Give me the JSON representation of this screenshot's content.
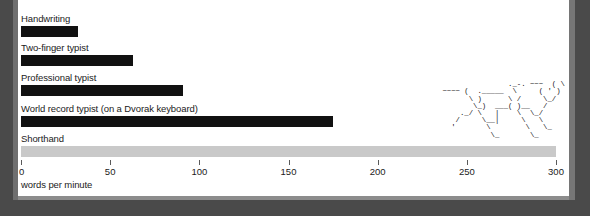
{
  "chart_data": {
    "type": "bar",
    "orientation": "horizontal",
    "title": "",
    "xlabel": "words per minute",
    "ylabel": "",
    "xlim": [
      0,
      300
    ],
    "ticks": [
      0,
      50,
      100,
      150,
      200,
      250,
      300
    ],
    "tick_labels": [
      "0",
      "50",
      "100",
      "150",
      "200",
      "250",
      "300"
    ],
    "grid": false,
    "legend": "none",
    "categories": [
      "Handwriting",
      "Two-finger typist",
      "Professional typist",
      "World record typist (on a Dvorak keyboard)",
      "Shorthand"
    ],
    "values": [
      32,
      63,
      91,
      175,
      300
    ],
    "bar_colors": [
      "#111111",
      "#111111",
      "#111111",
      "#111111",
      "#c9c9c9"
    ],
    "annotations": [
      "ascii-horse-drawing"
    ]
  },
  "axis": {
    "title": "words per minute"
  },
  "illustration": {
    "name": "ascii-horse",
    "art": "                              ~~~\n                ._-. ~~~  ( \\\n ~~~~ (  ._____  \\     ( ' )\n       \\ )      \\ /     \\_/\n        \\_)  ___( )__   /\n     ._/ \\   |    \\  \\_/\n    /     \\__|     \\   \\\n   '       \\        \\   \\_\n            \\_       \\_"
  }
}
